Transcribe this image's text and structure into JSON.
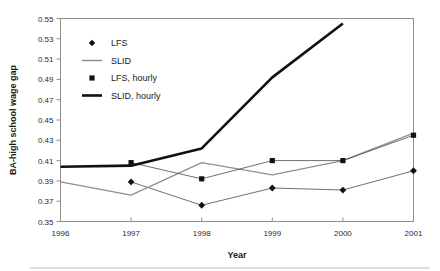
{
  "chart_data": {
    "type": "line",
    "title": "",
    "subtitle": "",
    "xlabel": "Year",
    "ylabel": "BA-high school wage gap",
    "x": [
      1996,
      1997,
      1998,
      1999,
      2000,
      2001
    ],
    "xlim": [
      1996,
      2001
    ],
    "ylim": [
      0.35,
      0.55
    ],
    "ytick_labels": [
      "0.55",
      "0.53",
      "0.51",
      "0.49",
      "0.47",
      "0.45",
      "0.43",
      "0.41",
      "0.39",
      "0.37",
      "0.35"
    ],
    "ytick_values": [
      0.55,
      0.53,
      0.51,
      0.49,
      0.47,
      0.45,
      0.43,
      0.41,
      0.39,
      0.37,
      0.35
    ],
    "xtick_labels": [
      "1996",
      "1997",
      "1998",
      "1999",
      "2000",
      "2001"
    ],
    "grid": false,
    "legend_position": "upper-left-inside",
    "series": [
      {
        "name": "LFS",
        "marker": "diamond",
        "x": [
          1997,
          1998,
          1999,
          2000,
          2001
        ],
        "values": [
          0.389,
          0.366,
          0.383,
          0.381,
          0.4
        ]
      },
      {
        "name": "SLID",
        "marker": "none",
        "x": [
          1996,
          1997,
          1998,
          1999,
          2000,
          2001
        ],
        "values": [
          0.389,
          0.376,
          0.408,
          0.396,
          0.41,
          0.437
        ]
      },
      {
        "name": "LFS, hourly",
        "marker": "square",
        "x": [
          1997,
          1998,
          1999,
          2000,
          2001
        ],
        "values": [
          0.408,
          0.392,
          0.41,
          0.41,
          0.435
        ]
      },
      {
        "name": "SLID, hourly",
        "marker": "none",
        "x": [
          1996,
          1997,
          1998,
          1999,
          2000
        ],
        "values": [
          0.404,
          0.405,
          0.422,
          0.492,
          0.545
        ]
      }
    ]
  },
  "legend": {
    "entries": [
      {
        "label": "LFS",
        "glyph": "diamond-marker-icon",
        "color": "#111111"
      },
      {
        "label": "SLID",
        "glyph": "thin-line-icon",
        "color": "#8f8f8f"
      },
      {
        "label": "LFS, hourly",
        "glyph": "square-marker-icon",
        "color": "#111111"
      },
      {
        "label": "SLID, hourly",
        "glyph": "thick-line-icon",
        "color": "#111111"
      }
    ]
  },
  "axes": {
    "x_title": "Year",
    "y_title": "BA-high school wage gap"
  }
}
